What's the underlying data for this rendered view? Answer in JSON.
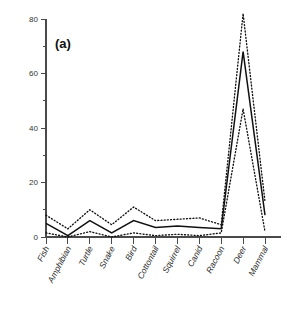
{
  "panel": {
    "label": "(a)"
  },
  "chart_data": {
    "type": "line",
    "title": "(a)",
    "xlabel": "",
    "ylabel": "",
    "ylim": [
      0,
      80
    ],
    "yticks": [
      0,
      20,
      40,
      60,
      80
    ],
    "ytick_labels": [
      "0",
      "20",
      "40",
      "60",
      "80"
    ],
    "minor_ytick_step": 10,
    "grid": false,
    "legend": null,
    "categories": [
      "Fish",
      "Amphibian",
      "Turtle",
      "Snake",
      "Bird",
      "Cottontail",
      "Squirrel",
      "Canid",
      "Racoon",
      "Deer",
      "Mammal"
    ],
    "series": [
      {
        "name": "mean",
        "style": "solid",
        "values": [
          5,
          0.5,
          6,
          1.5,
          6,
          3.5,
          4,
          3.5,
          3,
          68,
          8
        ]
      },
      {
        "name": "upper-confidence-limit",
        "style": "dotted",
        "values": [
          8,
          3,
          10,
          4.5,
          11,
          6,
          6.5,
          7,
          4.5,
          82,
          13
        ]
      },
      {
        "name": "lower-confidence-limit",
        "style": "dotted",
        "values": [
          1.5,
          0,
          2,
          0,
          1.5,
          0.5,
          1,
          0.5,
          1.5,
          47,
          2
        ]
      }
    ]
  }
}
